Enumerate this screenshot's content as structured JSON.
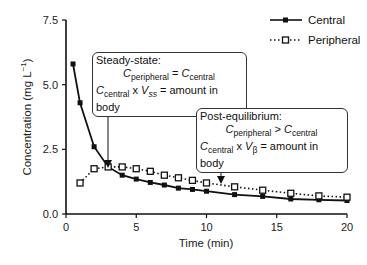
{
  "chart_data": {
    "type": "line",
    "title": "",
    "xlabel": "Time (min)",
    "ylabel": "Concentration (mg L⁻¹)",
    "xlim": [
      0,
      20
    ],
    "ylim": [
      0,
      7.5
    ],
    "xticks": [
      "0",
      "5",
      "10",
      "15",
      "20"
    ],
    "yticks": [
      "0.0",
      "2.5",
      "5.0",
      "7.5"
    ],
    "grid": false,
    "legend_position": "top-right",
    "series": [
      {
        "name": "Central",
        "style": "solid line, filled square markers",
        "x": [
          0.5,
          1,
          2,
          3,
          4,
          5,
          6,
          7,
          8,
          9,
          10,
          12,
          14,
          16,
          18,
          20
        ],
        "y": [
          5.8,
          4.3,
          2.6,
          1.82,
          1.5,
          1.35,
          1.22,
          1.12,
          1.0,
          0.95,
          0.88,
          0.75,
          0.68,
          0.58,
          0.55,
          0.52
        ]
      },
      {
        "name": "Peripheral",
        "style": "dotted line, open square markers",
        "x": [
          1,
          2,
          3,
          4,
          5,
          6,
          7,
          8,
          9,
          10,
          12,
          14,
          16,
          18,
          20
        ],
        "y": [
          1.2,
          1.75,
          1.82,
          1.82,
          1.75,
          1.65,
          1.5,
          1.4,
          1.3,
          1.2,
          1.05,
          0.92,
          0.8,
          0.7,
          0.65
        ]
      }
    ],
    "annotations": [
      {
        "title": "Steady-state:",
        "line1": "C_peripheral = C_central",
        "line2": "C_central x V_ss = amount in body",
        "arrow_to_x": 3
      },
      {
        "title": "Post-equilibrium:",
        "line1": "C_peripheral > C_central",
        "line2": "C_central x V_β = amount in body",
        "arrow_to_x": 11
      }
    ]
  },
  "legend": {
    "central": "Central",
    "peripheral": "Peripheral"
  },
  "axes": {
    "xlabel": "Time (min)",
    "ylabel_main": "Concentration (mg L",
    "ylabel_sup": "−1",
    "ylabel_end": ")"
  },
  "box1": {
    "title": "Steady-state:",
    "c": "C",
    "peripheral": "peripheral",
    "central": "central",
    "eq": " = ",
    "x": " x ",
    "v": "V",
    "ss": "ss",
    "rest": " = amount in body"
  },
  "box2": {
    "title": "Post-equilibrium:",
    "c": "C",
    "peripheral": "peripheral",
    "central": "central",
    "gt": " > ",
    "x": " x ",
    "v": "V",
    "beta": "β",
    "rest": " = amount in body"
  }
}
